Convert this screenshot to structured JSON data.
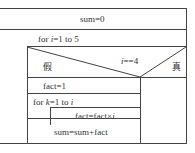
{
  "diagram": {
    "type": "nassi-shneiderman",
    "init": "sum=0",
    "outer_loop": {
      "prefix": "for ",
      "var": "i",
      "range": "=1 to 5"
    },
    "decision": {
      "condition_var": "i",
      "condition_op": "==4",
      "false_label": "假",
      "true_label": "真"
    },
    "false_branch": {
      "assign": "fact=1",
      "inner_loop": {
        "prefix": "for ",
        "var": "k",
        "range_a": "=1 to ",
        "range_b": "i"
      },
      "inner_body": {
        "text": "fact=fact×",
        "var": "i"
      },
      "after": "sum=sum+fact"
    },
    "true_branch": ""
  }
}
